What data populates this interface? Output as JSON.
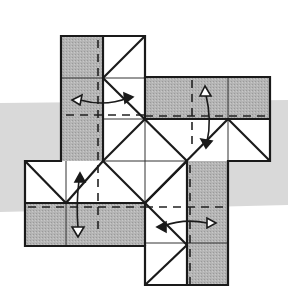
{
  "diagram": {
    "colors": {
      "background": "#ffffff",
      "band": "#d9d9d9",
      "paper_gray": "#b3b3b3",
      "paper_white": "#ffffff",
      "stroke": "#1a1a1a"
    },
    "arms": [
      {
        "name": "top",
        "arrow": "left-right"
      },
      {
        "name": "right",
        "arrow": "up-down"
      },
      {
        "name": "bottom",
        "arrow": "left-right"
      },
      {
        "name": "left",
        "arrow": "up-down"
      }
    ]
  }
}
